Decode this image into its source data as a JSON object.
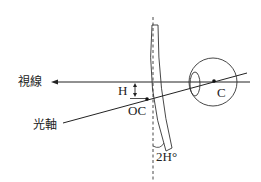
{
  "diagram": {
    "labels": {
      "line_of_sight": "視線",
      "optical_axis": "光軸",
      "height": "H",
      "optical_center": "OC",
      "center_of_rotation": "C",
      "tilt_angle": "2H°"
    },
    "colors": {
      "stroke": "#222222",
      "background": "#ffffff"
    }
  }
}
